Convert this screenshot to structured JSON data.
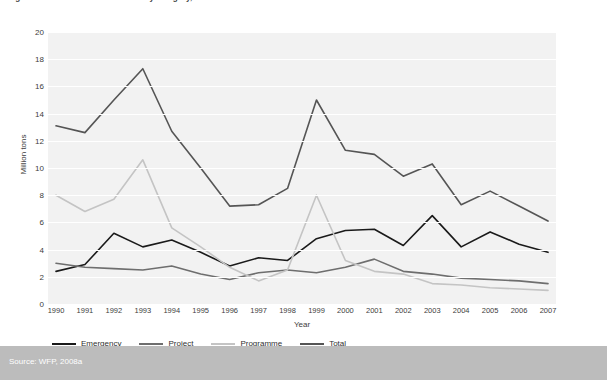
{
  "figure": {
    "title": "Figure 1  Global food aid deliveries by category, 1990–2007",
    "source": "Source: WFP, 2008a"
  },
  "axes": {
    "ylabel": "Million tons",
    "xlabel": "Year",
    "yticks": [
      "0",
      "2",
      "4",
      "6",
      "8",
      "10",
      "12",
      "14",
      "16",
      "18",
      "20"
    ]
  },
  "legend": {
    "items": [
      {
        "label": "Emergency",
        "color": "#1a1a1a"
      },
      {
        "label": "Project",
        "color": "#6e6e6e"
      },
      {
        "label": "Programme",
        "color": "#c4c4c4"
      },
      {
        "label": "Total",
        "color": "#555555"
      }
    ]
  },
  "chart_data": {
    "type": "line",
    "title": "Global food aid deliveries by category, 1990–2007",
    "xlabel": "Year",
    "ylabel": "Million tons",
    "ylim": [
      0,
      20
    ],
    "ytick_step": 2,
    "grid": "horizontal",
    "legend_position": "bottom-left",
    "x": [
      1990,
      1991,
      1992,
      1993,
      1994,
      1995,
      1996,
      1997,
      1998,
      1999,
      2000,
      2001,
      2002,
      2003,
      2004,
      2005,
      2006,
      2007
    ],
    "categories": [
      "1990",
      "1991",
      "1992",
      "1993",
      "1994",
      "1995",
      "1996",
      "1997",
      "1998",
      "1999",
      "2000",
      "2001",
      "2002",
      "2003",
      "2004",
      "2005",
      "2006",
      "2007"
    ],
    "series": [
      {
        "name": "Emergency",
        "color": "#1a1a1a",
        "values": [
          2.4,
          2.9,
          5.2,
          4.2,
          4.7,
          3.8,
          2.8,
          3.4,
          3.2,
          4.8,
          5.4,
          5.5,
          4.3,
          6.5,
          4.2,
          5.3,
          4.4,
          3.8
        ]
      },
      {
        "name": "Project",
        "color": "#6e6e6e",
        "values": [
          3.0,
          2.7,
          2.6,
          2.5,
          2.8,
          2.2,
          1.8,
          2.3,
          2.5,
          2.3,
          2.7,
          3.3,
          2.4,
          2.2,
          1.9,
          1.8,
          1.7,
          1.5
        ]
      },
      {
        "name": "Programme",
        "color": "#c4c4c4",
        "values": [
          8.0,
          6.8,
          7.7,
          10.6,
          5.6,
          4.2,
          2.7,
          1.7,
          2.5,
          8.0,
          3.2,
          2.4,
          2.2,
          1.5,
          1.4,
          1.2,
          1.1,
          1.0
        ]
      },
      {
        "name": "Total",
        "color": "#555555",
        "values": [
          13.1,
          12.6,
          15.0,
          17.3,
          12.7,
          10.0,
          7.2,
          7.3,
          8.5,
          15.0,
          11.3,
          11.0,
          9.4,
          10.3,
          7.3,
          8.3,
          7.2,
          6.1
        ]
      }
    ]
  }
}
